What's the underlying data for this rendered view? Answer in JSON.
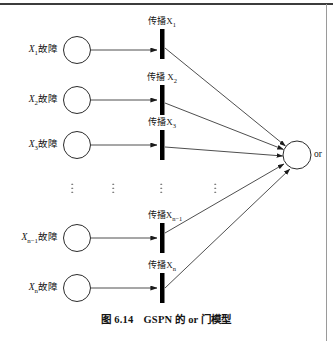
{
  "figure": {
    "caption_number": "图 6.14",
    "caption_title": "GSPN 的 or 门模型",
    "gate_output_label": "or",
    "ellipsis_glyph": "⋮",
    "rows": [
      {
        "id": "row-1",
        "place_label": "X₁故障",
        "place_label_base": "X",
        "place_label_sub": "1",
        "place_label_tail": "故障",
        "transition_label_base": "传播X",
        "transition_label_sub": "1",
        "place_cx": 77,
        "place_cy": 50,
        "place_r": 13.5,
        "bar_x": 160,
        "bar_y": 29,
        "bar_w": 4.5,
        "bar_h": 30
      },
      {
        "id": "row-2",
        "place_label": "X₂故障",
        "place_label_base": "X",
        "place_label_sub": "2",
        "place_label_tail": "故障",
        "transition_label_base": "传播 X",
        "transition_label_sub": "2",
        "place_cx": 77,
        "place_cy": 100,
        "place_r": 13.5,
        "bar_x": 160,
        "bar_y": 85,
        "bar_w": 4.5,
        "bar_h": 30
      },
      {
        "id": "row-3",
        "place_label": "X₃故障",
        "place_label_base": "X",
        "place_label_sub": "3",
        "place_label_tail": "故障",
        "transition_label_base": "传播X",
        "transition_label_sub": "3",
        "place_cx": 77,
        "place_cy": 145,
        "place_r": 13.5,
        "bar_x": 160,
        "bar_y": 130,
        "bar_w": 4.5,
        "bar_h": 30
      },
      {
        "id": "row-n-minus-1",
        "place_label": "Xₙ₋₁故障",
        "place_label_base": "X",
        "place_label_sub": "n−1",
        "place_label_tail": "故障",
        "transition_label_base": "传播X",
        "transition_label_sub": "n−1",
        "place_cx": 77,
        "place_cy": 238,
        "place_r": 13.5,
        "bar_x": 160,
        "bar_y": 223,
        "bar_w": 4.5,
        "bar_h": 30
      },
      {
        "id": "row-n",
        "place_label": "Xₙ故障",
        "place_label_base": "X",
        "place_label_sub": "n",
        "place_label_tail": "故障",
        "transition_label_base": "传播X",
        "transition_label_sub": "n",
        "place_cx": 77,
        "place_cy": 288,
        "place_r": 13.5,
        "bar_x": 160,
        "bar_y": 273,
        "bar_w": 4.5,
        "bar_h": 30
      }
    ],
    "ellipsis_columns": [
      {
        "id": "dots-places-label",
        "x": 72,
        "y": 188
      },
      {
        "id": "dots-places",
        "x": 113,
        "y": 188
      },
      {
        "id": "dots-transitions",
        "x": 161,
        "y": 188
      },
      {
        "id": "dots-arcs",
        "x": 215,
        "y": 188
      }
    ],
    "gate": {
      "cx": 297,
      "cy": 155,
      "r": 14,
      "label_x": 315,
      "label_y": 155
    },
    "colors": {
      "stroke": "#1a1a1a",
      "bar_fill": "#000000",
      "background": "#ffffff",
      "rule": "#3c3c3c",
      "arc": "#2b2b2b"
    }
  }
}
